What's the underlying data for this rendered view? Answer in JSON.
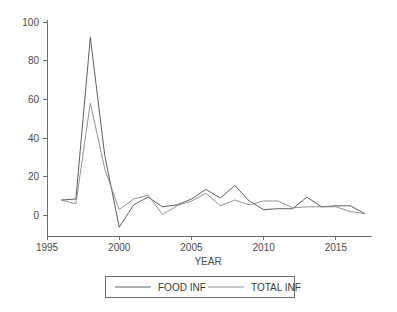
{
  "chart_data": {
    "type": "line",
    "title": "",
    "xlabel": "YEAR",
    "ylabel": "",
    "xlim": [
      1995,
      2017.5
    ],
    "ylim": [
      -10,
      104
    ],
    "grid": false,
    "legend_position": "bottom",
    "x": [
      1996,
      1997,
      1998,
      1999,
      2000,
      2001,
      2002,
      2003,
      2004,
      2005,
      2006,
      2007,
      2008,
      2009,
      2010,
      2011,
      2012,
      2013,
      2014,
      2015,
      2016,
      2017
    ],
    "xticks": [
      1995,
      2000,
      2005,
      2010,
      2015
    ],
    "xtick_labels": [
      "1995",
      "2000",
      "2005",
      "2010",
      "2015"
    ],
    "yticks": [
      0,
      20,
      40,
      60,
      80,
      100
    ],
    "ytick_labels": [
      "0",
      "20",
      "40",
      "60",
      "80",
      "100"
    ],
    "series": [
      {
        "name": "FOOD INF",
        "color": "#4d4d4d",
        "values": [
          8.0,
          8.5,
          92.0,
          31.0,
          -6.0,
          5.5,
          9.5,
          4.5,
          5.5,
          8.5,
          13.5,
          9.0,
          15.5,
          7.5,
          3.0,
          3.5,
          3.5,
          9.5,
          4.5,
          5.0,
          5.0,
          1.0
        ]
      },
      {
        "name": "TOTAL INF",
        "color": "#868686",
        "values": [
          8.0,
          6.0,
          58.0,
          24.0,
          3.0,
          8.5,
          10.5,
          0.5,
          5.0,
          7.5,
          11.5,
          5.0,
          8.0,
          5.5,
          7.5,
          7.5,
          4.0,
          4.5,
          4.5,
          4.5,
          2.0,
          1.0
        ]
      }
    ]
  },
  "axes": {
    "x_title": "YEAR"
  },
  "legend": {
    "items": [
      {
        "label": "FOOD INF"
      },
      {
        "label": "TOTAL INF"
      }
    ]
  }
}
